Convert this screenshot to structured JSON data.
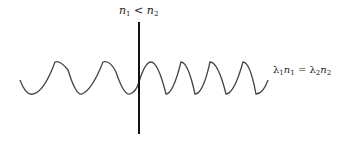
{
  "diagram": {
    "top_label": {
      "a": "n",
      "a_sub": "1",
      "op": " < ",
      "b": "n",
      "b_sub": "2"
    },
    "right_label": {
      "a": "λ",
      "a_sub": "1",
      "b": "n",
      "b_sub": "1",
      "eq": " = ",
      "c": "λ",
      "c_sub": "2",
      "d": "n",
      "d_sub": "2"
    },
    "colors": {
      "wave": "#444444",
      "boundary": "#111111",
      "text": "#222222"
    }
  }
}
